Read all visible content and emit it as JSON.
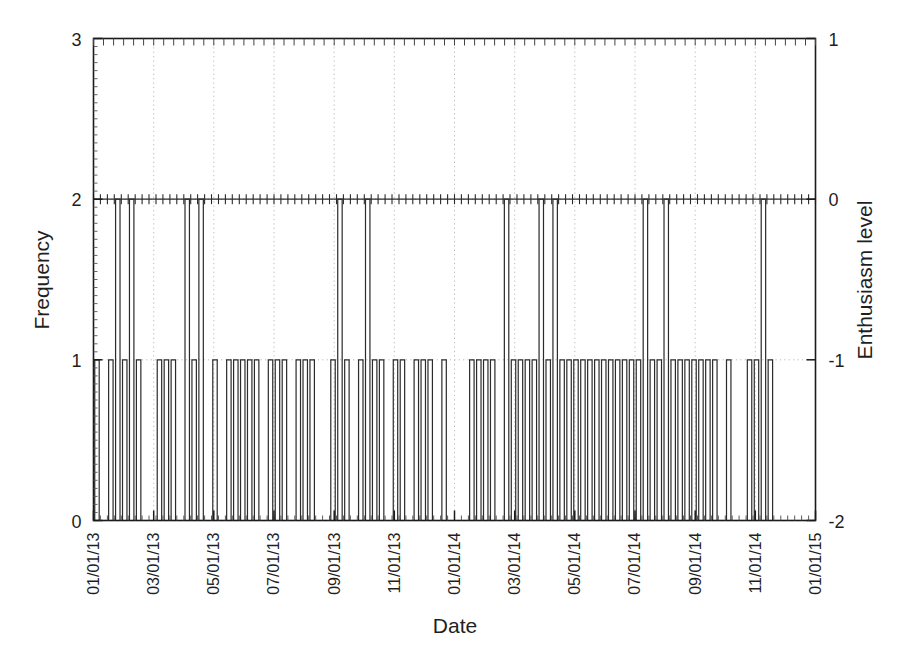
{
  "chart_data": {
    "type": "bar",
    "title": "",
    "subtitle": "",
    "xlabel": "Date",
    "ylabel": "Frequency",
    "y2label": "Enthusiasm level",
    "grid": true,
    "grid_style": "dotted-vertical",
    "legend": "none",
    "xlim": [
      "01/01/13",
      "01/01/15"
    ],
    "ylim": [
      0,
      3
    ],
    "y2lim": [
      -2,
      1
    ],
    "yticks": [
      0,
      1,
      2,
      3
    ],
    "ytick_labels": [
      "0",
      "1",
      "2",
      "3"
    ],
    "y2ticks": [
      -2,
      -1,
      0,
      1
    ],
    "y2tick_labels": [
      "-2",
      "-1",
      "0",
      "1"
    ],
    "xtick_labels": [
      "01/01/13",
      "03/01/13",
      "05/01/13",
      "07/01/13",
      "09/01/13",
      "11/01/13",
      "01/01/14",
      "03/01/14",
      "05/01/14",
      "07/01/14",
      "09/01/14",
      "11/01/14",
      "01/01/15"
    ],
    "xtick_rotation_deg": 90,
    "bar_fill": "none",
    "bar_edge_color": "#2b2b2b",
    "axis_color": "#1a1a1a",
    "gridline_color": "#b9b9b9",
    "background_color": "#ffffff",
    "bar_note": "Histogram of event counts binned weekly; most non-empty bins have frequency 1, a few have frequency 2.",
    "bins_per_axis": 104,
    "bin_unit": "week",
    "values": [
      1,
      0,
      1,
      2,
      1,
      2,
      1,
      0,
      0,
      1,
      1,
      1,
      0,
      2,
      1,
      2,
      0,
      1,
      0,
      1,
      1,
      1,
      1,
      1,
      0,
      1,
      1,
      1,
      0,
      1,
      1,
      1,
      0,
      0,
      1,
      2,
      1,
      0,
      1,
      2,
      1,
      1,
      0,
      1,
      1,
      0,
      1,
      1,
      1,
      0,
      1,
      0,
      0,
      0,
      1,
      1,
      1,
      1,
      0,
      2,
      1,
      1,
      1,
      1,
      2,
      1,
      2,
      1,
      1,
      1,
      1,
      1,
      1,
      1,
      1,
      1,
      1,
      1,
      1,
      2,
      1,
      1,
      2,
      1,
      1,
      1,
      1,
      1,
      1,
      1,
      0,
      1,
      0,
      0,
      1,
      1,
      2,
      1,
      0,
      0,
      0,
      0,
      0,
      0
    ]
  }
}
